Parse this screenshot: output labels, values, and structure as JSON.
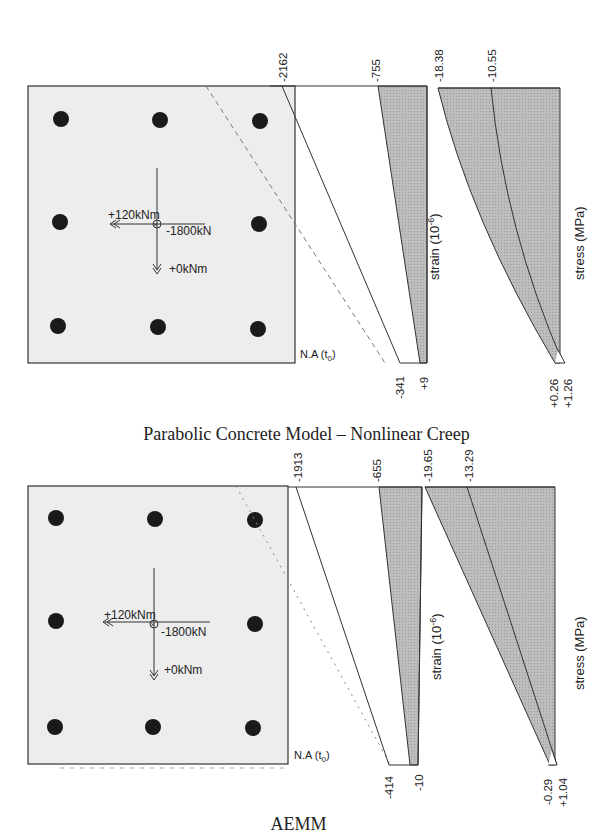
{
  "figure": {
    "panels": [
      {
        "caption": "Parabolic Concrete Model – Nonlinear Creep",
        "section": {
          "axial_force": "-1800kN",
          "moment_x": "+120kNm",
          "moment_y": "+0kNm",
          "neutral_axis_label": "N.A (t",
          "neutral_axis_sub": "0",
          "neutral_axis_close": ")"
        },
        "strain": {
          "axis_label": "strain (10",
          "axis_exp": "-6",
          "axis_close": ")",
          "top_values": [
            "-2162",
            "-755"
          ],
          "bottom_values": [
            "-341",
            "+9"
          ]
        },
        "stress": {
          "axis_label": "stress (MPa)",
          "top_values": [
            "-18.38",
            "-10.55"
          ],
          "bottom_values": [
            "+0.26",
            "+1.26"
          ]
        }
      },
      {
        "caption": "AEMM",
        "section": {
          "axial_force": "-1800kN",
          "moment_x": "+120kNm",
          "moment_y": "+0kNm",
          "neutral_axis_label": "N.A (t",
          "neutral_axis_sub": "0",
          "neutral_axis_close": ")"
        },
        "strain": {
          "axis_label": "strain (10",
          "axis_exp": "-6",
          "axis_close": ")",
          "top_values": [
            "-1913",
            "-655"
          ],
          "bottom_values": [
            "-414",
            "-10"
          ]
        },
        "stress": {
          "axis_label": "stress (MPa)",
          "top_values": [
            "-19.65",
            "-13.29"
          ],
          "bottom_values": [
            "-0.29",
            "+1.04"
          ]
        }
      }
    ],
    "colors": {
      "section_fill": "#ececec",
      "shaded_fill": "#b9b9b9",
      "line": "#333333",
      "rebar": "#1a1a1a"
    }
  }
}
